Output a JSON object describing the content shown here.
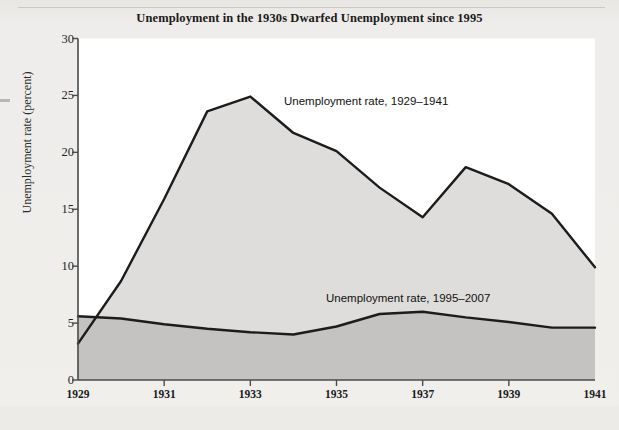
{
  "figure": {
    "title": "Unemployment in the 1930s Dwarfed Unemployment since 1995",
    "ylabel": "Unemployment rate (percent)",
    "note_upper": "Unemployment rate, 1929–1941",
    "note_lower": "Unemployment rate, 1995–2007",
    "colors": {
      "background": "#f0efec",
      "upper_fill": "#dedddb",
      "lower_fill": "#c4c3c1",
      "line": "#1c1c1c",
      "axis": "#4a4a4a",
      "text": "#1a1a1a"
    }
  },
  "chart_data": {
    "type": "area",
    "title": "Unemployment in the 1930s Dwarfed Unemployment since 1995",
    "xlabel": "",
    "ylabel": "Unemployment rate (percent)",
    "ylim": [
      0,
      30
    ],
    "yticks": [
      0,
      5,
      10,
      15,
      20,
      25,
      30
    ],
    "ytick_labels": [
      "0",
      "5",
      "10",
      "15",
      "20",
      "25",
      "30"
    ],
    "grid": false,
    "legend": "inline-annotations",
    "x_primary": [
      1929,
      1930,
      1931,
      1932,
      1933,
      1934,
      1935,
      1936,
      1937,
      1938,
      1939,
      1940,
      1941
    ],
    "x_secondary": [
      1995,
      1996,
      1997,
      1998,
      1999,
      2000,
      2001,
      2002,
      2003,
      2004,
      2005,
      2006,
      2007
    ],
    "xtick_labels_top": [
      "1929",
      "1931",
      "1933",
      "1935",
      "1937",
      "1939",
      "1941"
    ],
    "xtick_labels_bottom": [
      "1995",
      "1997",
      "1999",
      "2001",
      "2003",
      "2005",
      "2007"
    ],
    "xtick_positions": [
      1929,
      1931,
      1933,
      1935,
      1937,
      1939,
      1941
    ],
    "series": [
      {
        "name": "Unemployment rate, 1929–1941",
        "axis": "x_primary",
        "values": [
          3.2,
          8.7,
          15.9,
          23.6,
          24.9,
          21.7,
          20.1,
          16.9,
          14.3,
          18.7,
          17.2,
          14.6,
          9.9
        ]
      },
      {
        "name": "Unemployment rate, 1995–2007",
        "axis": "x_secondary",
        "values": [
          5.6,
          5.4,
          4.9,
          4.5,
          4.2,
          4.0,
          4.7,
          5.8,
          6.0,
          5.5,
          5.1,
          4.6,
          4.6
        ]
      }
    ]
  }
}
